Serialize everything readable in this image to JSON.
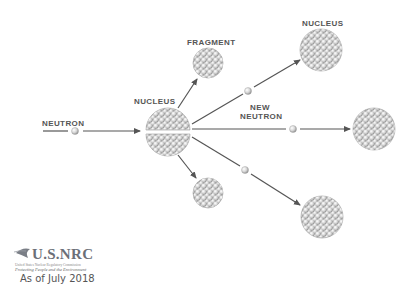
{
  "title_cut": "Nuclear Fission",
  "labels": {
    "neutron": "NEUTRON",
    "nucleus_center": "NUCLEUS",
    "fragment": "FRAGMENT",
    "nucleus_right": "NUCLEUS",
    "new_neutron_line1": "NEW",
    "new_neutron_line2": "NEUTRON"
  },
  "logo": {
    "name": "U.S.NRC",
    "subtitle": "United States Nuclear Regulatory Commission",
    "tagline": "Protecting People and the Environment"
  },
  "footer": {
    "date_text": "As of July 2018"
  },
  "colors": {
    "arrow": "#555555",
    "label": "#555555",
    "nucleus_fill": "#d8d8d8",
    "nucleus_edge": "#9a9a9a"
  }
}
